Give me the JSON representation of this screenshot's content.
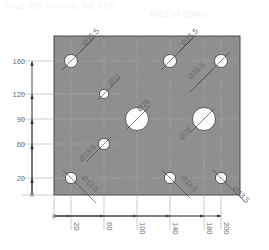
{
  "watermark": {
    "left": "CAD DRAWING   PLATE",
    "right": "MECH  DWG"
  },
  "colors": {
    "plate_fill": "#8f8f8f",
    "plate_edge": "#4a4a4a",
    "hole_fill": "#ffffff",
    "dim_line": "#7a7a7a",
    "text": "#6e6e6e",
    "background": "#ffffff"
  },
  "plate": {
    "width_mm": 220,
    "height_mm": 190,
    "origin_label": "0"
  },
  "y_axis": {
    "ticks": [
      {
        "value": 20,
        "label": "20"
      },
      {
        "value": 60,
        "label": "60"
      },
      {
        "value": 90,
        "label": "90"
      },
      {
        "value": 120,
        "label": "120"
      },
      {
        "value": 160,
        "label": "160"
      }
    ],
    "origin_label": "0"
  },
  "x_axis": {
    "ticks": [
      {
        "value": 20,
        "label": "20"
      },
      {
        "value": 60,
        "label": "60"
      },
      {
        "value": 100,
        "label": "100"
      },
      {
        "value": 140,
        "label": "140"
      },
      {
        "value": 180,
        "label": "180"
      },
      {
        "value": 200,
        "label": "200"
      }
    ],
    "origin_label": "0"
  },
  "holes": [
    {
      "x": 20,
      "y": 160,
      "dia": 15.5,
      "label": "Ø15.5",
      "leader": "up-right"
    },
    {
      "x": 140,
      "y": 160,
      "dia": 15.5,
      "label": "Ø15.5",
      "leader": "up-right"
    },
    {
      "x": 200,
      "y": 160,
      "dia": 15.5,
      "label": "Ø15.5",
      "leader": "down-left"
    },
    {
      "x": 60,
      "y": 120,
      "dia": 11,
      "label": "Ø11",
      "leader": "up-right"
    },
    {
      "x": 100,
      "y": 90,
      "dia": 28,
      "label": "Ø28",
      "leader": "up-right"
    },
    {
      "x": 180,
      "y": 90,
      "dia": 28,
      "label": "Ø28",
      "leader": "down-left"
    },
    {
      "x": 60,
      "y": 60,
      "dia": 13.5,
      "label": "Ø13.5",
      "leader": "down-left"
    },
    {
      "x": 20,
      "y": 20,
      "dia": 13.5,
      "label": "Ø13.5",
      "leader": "down-right"
    },
    {
      "x": 140,
      "y": 20,
      "dia": 13.5,
      "label": "Ø13.5",
      "leader": "down-right"
    },
    {
      "x": 200,
      "y": 20,
      "dia": 13.5,
      "label": "Ø13.5",
      "leader": "down-right"
    }
  ]
}
